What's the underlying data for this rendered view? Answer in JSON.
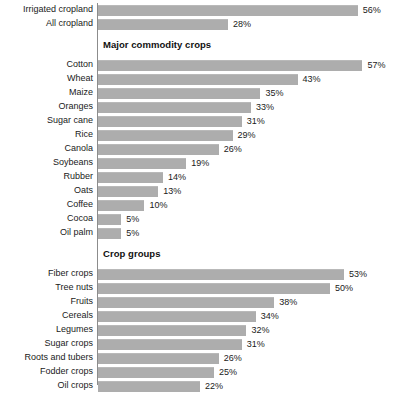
{
  "chart_data": {
    "type": "bar",
    "title": "",
    "subtitle": "",
    "xlabel": "",
    "ylabel": "",
    "xlim": [
      0,
      65
    ],
    "grid": false,
    "legend": null,
    "orientation": "horizontal",
    "value_suffix": "%",
    "bar_color": "#adadad",
    "axis_color": "#8c8c8c",
    "text_color": "#1a1a1a",
    "px_per_percent": 4.64,
    "sections": [
      {
        "header": "",
        "has_header": false,
        "rows": [
          {
            "label": "Irrigated cropland",
            "value": 56,
            "value_label": "56%"
          },
          {
            "label": "All cropland",
            "value": 28,
            "value_label": "28%"
          }
        ]
      },
      {
        "header": "Major commodity crops",
        "has_header": true,
        "rows": [
          {
            "label": "Cotton",
            "value": 57,
            "value_label": "57%"
          },
          {
            "label": "Wheat",
            "value": 43,
            "value_label": "43%"
          },
          {
            "label": "Maize",
            "value": 35,
            "value_label": "35%"
          },
          {
            "label": "Oranges",
            "value": 33,
            "value_label": "33%"
          },
          {
            "label": "Sugar cane",
            "value": 31,
            "value_label": "31%"
          },
          {
            "label": "Rice",
            "value": 29,
            "value_label": "29%"
          },
          {
            "label": "Canola",
            "value": 26,
            "value_label": "26%"
          },
          {
            "label": "Soybeans",
            "value": 19,
            "value_label": "19%"
          },
          {
            "label": "Rubber",
            "value": 14,
            "value_label": "14%"
          },
          {
            "label": "Oats",
            "value": 13,
            "value_label": "13%"
          },
          {
            "label": "Coffee",
            "value": 10,
            "value_label": "10%"
          },
          {
            "label": "Cocoa",
            "value": 5,
            "value_label": "5%"
          },
          {
            "label": "Oil palm",
            "value": 5,
            "value_label": "5%"
          }
        ]
      },
      {
        "header": "Crop groups",
        "has_header": true,
        "rows": [
          {
            "label": "Fiber crops",
            "value": 53,
            "value_label": "53%"
          },
          {
            "label": "Tree nuts",
            "value": 50,
            "value_label": "50%"
          },
          {
            "label": "Fruits",
            "value": 38,
            "value_label": "38%"
          },
          {
            "label": "Cereals",
            "value": 34,
            "value_label": "34%"
          },
          {
            "label": "Legumes",
            "value": 32,
            "value_label": "32%"
          },
          {
            "label": "Sugar crops",
            "value": 31,
            "value_label": "31%"
          },
          {
            "label": "Roots and tubers",
            "value": 26,
            "value_label": "26%"
          },
          {
            "label": "Fodder crops",
            "value": 25,
            "value_label": "25%"
          },
          {
            "label": "Oil crops",
            "value": 22,
            "value_label": "22%"
          }
        ]
      }
    ],
    "categories": [
      "Irrigated cropland",
      "All cropland",
      "Cotton",
      "Wheat",
      "Maize",
      "Oranges",
      "Sugar cane",
      "Rice",
      "Canola",
      "Soybeans",
      "Rubber",
      "Oats",
      "Coffee",
      "Cocoa",
      "Oil palm",
      "Fiber crops",
      "Tree nuts",
      "Fruits",
      "Cereals",
      "Legumes",
      "Sugar crops",
      "Roots and tubers",
      "Fodder crops",
      "Oil crops"
    ],
    "values": [
      56,
      28,
      57,
      43,
      35,
      33,
      31,
      29,
      26,
      19,
      14,
      13,
      10,
      5,
      5,
      53,
      50,
      38,
      34,
      32,
      31,
      26,
      25,
      22
    ]
  }
}
